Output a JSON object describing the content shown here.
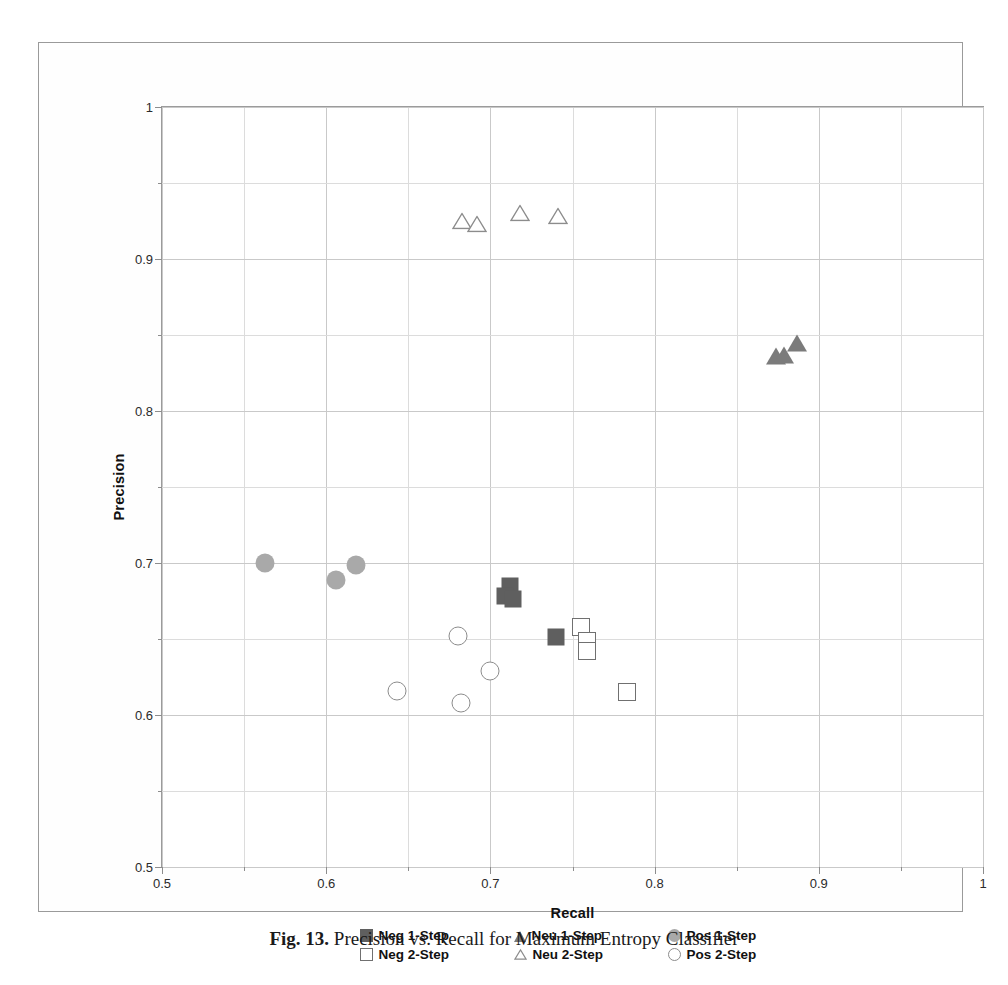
{
  "figure": {
    "caption_bold": "Fig. 13.",
    "caption_text": "Precision vs. Recall for Maximum Entropy Classifier"
  },
  "chart_data": {
    "type": "scatter",
    "title": "",
    "xlabel": "Recall",
    "ylabel": "Precision",
    "xlim": [
      0.5,
      1
    ],
    "ylim": [
      0.5,
      1
    ],
    "xticks": [
      "0.5",
      "0.6",
      "0.7",
      "0.8",
      "0.9",
      "1"
    ],
    "yticks": [
      "0.5",
      "0.6",
      "0.7",
      "0.8",
      "0.9",
      "1"
    ],
    "xtick_values": [
      0.5,
      0.6,
      0.7,
      0.8,
      0.9,
      1
    ],
    "ytick_values": [
      0.5,
      0.6,
      0.7,
      0.8,
      0.9,
      1
    ],
    "minor_tick_step": 0.05,
    "grid": true,
    "legend_position": "bottom",
    "colors": {
      "neg_1step": "#5f5f5f",
      "neu_1step": "#7b7b7b",
      "pos_1step": "#a9a9a9",
      "neg_2step": "#707070",
      "neu_2step": "#8c8c8c",
      "pos_2step": "#8c8c8c"
    },
    "series": [
      {
        "name": "Neg 1-Step",
        "marker": "square-filled",
        "points": [
          {
            "x": 0.712,
            "y": 0.685
          },
          {
            "x": 0.709,
            "y": 0.678
          },
          {
            "x": 0.714,
            "y": 0.676
          },
          {
            "x": 0.74,
            "y": 0.651
          }
        ]
      },
      {
        "name": "Neu 1-Step",
        "marker": "triangle-filled",
        "points": [
          {
            "x": 0.874,
            "y": 0.836
          },
          {
            "x": 0.879,
            "y": 0.837
          },
          {
            "x": 0.887,
            "y": 0.845
          }
        ]
      },
      {
        "name": "Pos 1-Step",
        "marker": "circle-filled",
        "points": [
          {
            "x": 0.563,
            "y": 0.7
          },
          {
            "x": 0.606,
            "y": 0.689
          },
          {
            "x": 0.618,
            "y": 0.699
          }
        ]
      },
      {
        "name": "Neg 2-Step",
        "marker": "square-open",
        "points": [
          {
            "x": 0.755,
            "y": 0.658
          },
          {
            "x": 0.759,
            "y": 0.649
          },
          {
            "x": 0.759,
            "y": 0.642
          },
          {
            "x": 0.783,
            "y": 0.615
          }
        ]
      },
      {
        "name": "Neu 2-Step",
        "marker": "triangle-open",
        "points": [
          {
            "x": 0.683,
            "y": 0.925
          },
          {
            "x": 0.692,
            "y": 0.923
          },
          {
            "x": 0.718,
            "y": 0.93
          },
          {
            "x": 0.741,
            "y": 0.928
          }
        ]
      },
      {
        "name": "Pos 2-Step",
        "marker": "circle-open",
        "points": [
          {
            "x": 0.68,
            "y": 0.652
          },
          {
            "x": 0.643,
            "y": 0.616
          },
          {
            "x": 0.7,
            "y": 0.629
          },
          {
            "x": 0.682,
            "y": 0.608
          }
        ]
      }
    ]
  },
  "legend": {
    "rows": [
      [
        {
          "label": "Neg 1-Step",
          "marker": "square-filled"
        },
        {
          "label": "Neu 1-Step",
          "marker": "triangle-filled"
        },
        {
          "label": "Pos 1-Step",
          "marker": "circle-filled"
        }
      ],
      [
        {
          "label": "Neg 2-Step",
          "marker": "square-open"
        },
        {
          "label": "Neu 2-Step",
          "marker": "triangle-open"
        },
        {
          "label": "Pos 2-Step",
          "marker": "circle-open"
        }
      ]
    ]
  }
}
